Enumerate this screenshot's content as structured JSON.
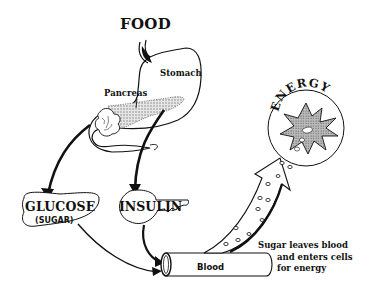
{
  "diagram": {
    "type": "process-flow",
    "topic": "Glucose and insulin metabolism",
    "nodes": {
      "food": "FOOD",
      "stomach": "Stomach",
      "pancreas": "Pancreas",
      "glucose": "GLUCOSE",
      "glucose_sub": "(SUGAR)",
      "insulin": "INSULIN",
      "blood": "Blood",
      "energy": "ENERGY"
    },
    "annotation": {
      "line1": "Sugar leaves blood",
      "line2": "and enters cells",
      "line3": "for energy"
    },
    "edges": [
      {
        "from": "FOOD",
        "to": "Stomach"
      },
      {
        "from": "Stomach",
        "to": "GLUCOSE"
      },
      {
        "from": "Pancreas",
        "to": "INSULIN"
      },
      {
        "from": "GLUCOSE",
        "to": "Blood"
      },
      {
        "from": "INSULIN",
        "to": "Blood"
      },
      {
        "from": "Blood",
        "to": "ENERGY"
      }
    ],
    "colors": {
      "ink": "#111111",
      "shade": "#9a9a9a",
      "background": "#ffffff"
    }
  }
}
